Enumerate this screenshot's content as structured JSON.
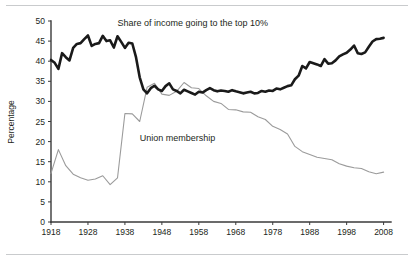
{
  "figure": {
    "name": "income-share-union-membership-chart",
    "background": "#ffffff",
    "rule_color": "#c9cbcd"
  },
  "chart_data": {
    "type": "line",
    "title": "",
    "xlabel": "",
    "ylabel": "Percentage",
    "xlim": [
      1918,
      2010
    ],
    "ylim": [
      0,
      50
    ],
    "grid": false,
    "legend_position": "inline-annotation",
    "y_ticks": [
      0,
      5,
      10,
      15,
      20,
      25,
      30,
      35,
      40,
      45,
      50
    ],
    "y_tick_labels": [
      "0",
      "5",
      "10",
      "15",
      "20",
      "25",
      "30",
      "35",
      "40",
      "45",
      "50"
    ],
    "x_ticks": [
      1918,
      1928,
      1938,
      1948,
      1958,
      1968,
      1978,
      1988,
      1998,
      2008
    ],
    "x_tick_labels": [
      "1918",
      "1928",
      "1938",
      "1948",
      "1958",
      "1968",
      "1978",
      "1988",
      "1998",
      "2008"
    ],
    "annotations": [
      {
        "text": "Share of income going to the top 10%",
        "x": 1936,
        "y": 48.8,
        "color": "#231f20"
      },
      {
        "text": "Union membership",
        "x": 1942,
        "y": 20.2,
        "color": "#231f20"
      }
    ],
    "series": [
      {
        "name": "Share of income going to the top 10%",
        "color": "#1a1a1a",
        "width": 2.6,
        "x": [
          1918,
          1919,
          1920,
          1921,
          1922,
          1923,
          1924,
          1925,
          1926,
          1927,
          1928,
          1929,
          1930,
          1931,
          1932,
          1933,
          1934,
          1935,
          1936,
          1937,
          1938,
          1939,
          1940,
          1941,
          1942,
          1943,
          1944,
          1945,
          1946,
          1947,
          1948,
          1949,
          1950,
          1951,
          1952,
          1953,
          1954,
          1955,
          1956,
          1957,
          1958,
          1959,
          1960,
          1961,
          1962,
          1963,
          1964,
          1965,
          1966,
          1967,
          1968,
          1969,
          1970,
          1971,
          1972,
          1973,
          1974,
          1975,
          1976,
          1977,
          1978,
          1979,
          1980,
          1981,
          1982,
          1983,
          1984,
          1985,
          1986,
          1987,
          1988,
          1989,
          1990,
          1991,
          1992,
          1993,
          1994,
          1995,
          1996,
          1997,
          1998,
          1999,
          2000,
          2001,
          2002,
          2003,
          2004,
          2005,
          2006,
          2007,
          2008
        ],
        "values": [
          40.3,
          39.6,
          38.1,
          42.0,
          41.0,
          40.2,
          43.3,
          44.3,
          44.5,
          45.5,
          46.4,
          43.8,
          44.3,
          44.5,
          46.3,
          45.0,
          45.2,
          43.4,
          46.2,
          44.8,
          43.3,
          44.6,
          44.4,
          41.0,
          36.0,
          33.0,
          32.0,
          33.3,
          33.9,
          33.0,
          32.6,
          33.8,
          34.5,
          33.0,
          32.6,
          32.0,
          32.9,
          32.5,
          32.1,
          31.7,
          32.4,
          32.2,
          32.8,
          33.3,
          32.8,
          32.5,
          32.7,
          32.6,
          32.4,
          32.8,
          32.5,
          32.3,
          32.0,
          32.2,
          32.4,
          32.0,
          32.1,
          32.6,
          32.4,
          32.7,
          32.6,
          33.2,
          33.0,
          33.4,
          33.8,
          34.0,
          35.5,
          36.4,
          38.8,
          38.2,
          39.8,
          39.5,
          39.2,
          38.8,
          40.5,
          39.4,
          39.5,
          40.2,
          41.2,
          41.7,
          42.1,
          42.9,
          43.9,
          42.0,
          41.8,
          42.2,
          43.6,
          44.9,
          45.5,
          45.6,
          45.8
        ],
        "note": "Dense annual series; rises from ~40% in 1918 to ~46% peak late 1920s-1930s, collapses to ~33% in early 1940s, flat through 1970s, rises to ~46-49% by 2007-2008"
      },
      {
        "name": "Union membership",
        "color": "#9b9b9b",
        "width": 1.1,
        "x": [
          1918,
          1920,
          1922,
          1924,
          1926,
          1928,
          1930,
          1932,
          1934,
          1936,
          1938,
          1940,
          1942,
          1944,
          1946,
          1948,
          1950,
          1952,
          1954,
          1956,
          1958,
          1960,
          1962,
          1964,
          1966,
          1968,
          1970,
          1972,
          1974,
          1976,
          1978,
          1980,
          1982,
          1984,
          1986,
          1988,
          1990,
          1992,
          1994,
          1996,
          1998,
          2000,
          2002,
          2004,
          2006,
          2008
        ],
        "values": [
          12.1,
          18.0,
          14.0,
          11.9,
          11.0,
          10.4,
          10.7,
          11.5,
          9.3,
          11.0,
          27.0,
          26.9,
          25.0,
          33.5,
          34.5,
          31.8,
          31.5,
          32.5,
          34.7,
          33.4,
          33.2,
          31.4,
          30.0,
          29.5,
          28.0,
          27.9,
          27.4,
          27.3,
          26.2,
          25.5,
          23.8,
          23.0,
          21.9,
          18.8,
          17.5,
          16.8,
          16.1,
          15.8,
          15.5,
          14.5,
          13.9,
          13.5,
          13.3,
          12.5,
          12.0,
          12.4
        ],
        "note": "Starts ~12% 1918, peaks ~18% 1920, dips to ~9-11% through 1930s, jumps to ~34-35% mid 1940s-1950s, then steady decline to ~12% by 2008"
      }
    ]
  }
}
